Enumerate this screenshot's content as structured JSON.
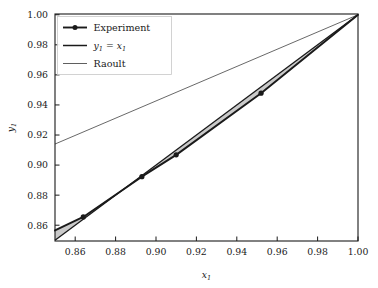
{
  "chart_data": {
    "type": "line",
    "title": "",
    "xlabel": "x₁",
    "ylabel": "y₁",
    "xlim": [
      0.85,
      1.0
    ],
    "ylim": [
      0.8495,
      1.0005
    ],
    "xticks": [
      "0.86",
      "0.88",
      "0.90",
      "0.92",
      "0.94",
      "0.96",
      "0.98",
      "1.00"
    ],
    "xtick_values": [
      0.86,
      0.88,
      0.9,
      0.92,
      0.94,
      0.96,
      0.98,
      1.0
    ],
    "yticks": [
      "0.86",
      "0.88",
      "0.90",
      "0.92",
      "0.94",
      "0.96",
      "0.98",
      "1.00"
    ],
    "ytick_values": [
      0.86,
      0.88,
      0.9,
      0.92,
      0.94,
      0.96,
      0.98,
      1.0
    ],
    "grid": false,
    "legend_position": "upper left",
    "series": [
      {
        "name": "Experiment",
        "style": "line-with-markers",
        "color": "#1a1a1a",
        "linewidth": 1.9,
        "marker": "circle",
        "x": [
          0.85,
          0.864,
          0.893,
          0.91,
          0.952,
          1.0
        ],
        "y": [
          0.8565,
          0.8655,
          0.8923,
          0.9068,
          0.9478,
          1.0
        ],
        "marker_x": [
          0.864,
          0.893,
          0.91,
          0.952
        ],
        "marker_y": [
          0.8655,
          0.8923,
          0.9068,
          0.9478
        ]
      },
      {
        "name": "y₁ = x₁",
        "style": "line",
        "color": "#1a1a1a",
        "linewidth": 1.3,
        "x": [
          0.85,
          1.0
        ],
        "y": [
          0.85,
          1.0
        ]
      },
      {
        "name": "Raoult",
        "style": "line",
        "color": "#4d4d4d",
        "linewidth": 0.85,
        "x": [
          0.85,
          1.0
        ],
        "y": [
          0.914,
          1.0
        ]
      }
    ],
    "shaded_region": {
      "name": "area-between-experiment-and-diagonal",
      "fill": "#b8b8b8",
      "opacity": 0.75,
      "between": [
        "Experiment",
        "y₁ = x₁"
      ]
    }
  },
  "legend": {
    "entries": [
      {
        "label": "Experiment",
        "kind": "text"
      },
      {
        "label": "y",
        "sub": "1",
        "label2": " = x",
        "sub2": "1",
        "kind": "math"
      },
      {
        "label": "Raoult",
        "kind": "text"
      }
    ]
  },
  "axes": {
    "x_label_base": "x",
    "x_label_sub": "1",
    "y_label_base": "y",
    "y_label_sub": "1"
  }
}
